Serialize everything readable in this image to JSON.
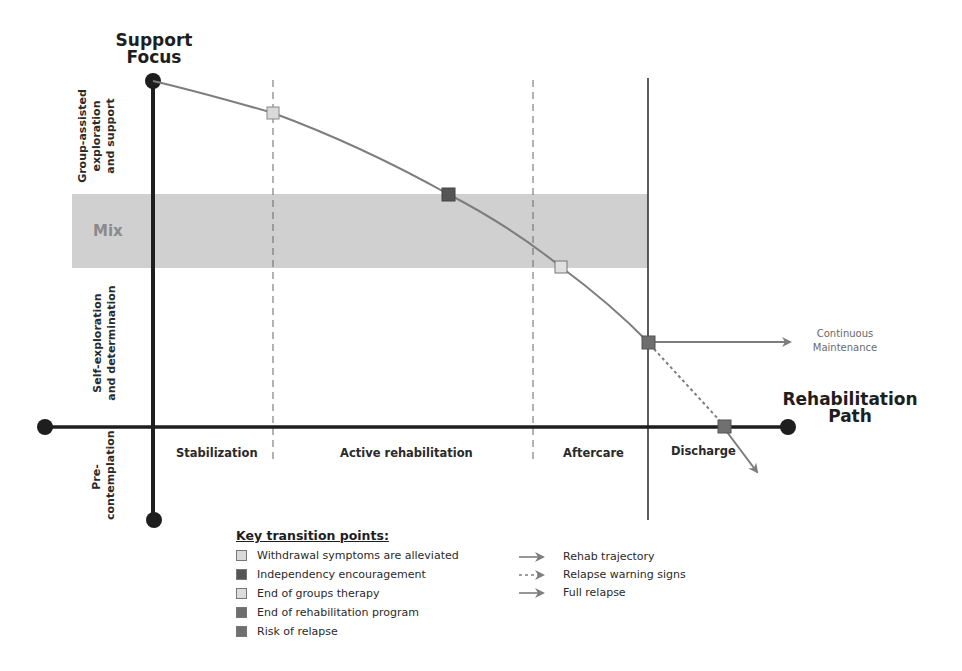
{
  "diagram": {
    "y_axis_title": "Support Focus",
    "y_axis_title_lines": [
      "Support",
      "Focus"
    ],
    "x_axis_title_lines": [
      "Rehabilitation",
      "Path"
    ],
    "x_axis_title": "Rehabilitation Path",
    "y_zones": [
      {
        "id": "group",
        "lines": [
          "Group-assisted",
          "exploration",
          "and support"
        ]
      },
      {
        "id": "mix",
        "label": "Mix"
      },
      {
        "id": "self",
        "lines": [
          "Self-exploration",
          "and determination"
        ]
      },
      {
        "id": "pre",
        "lines": [
          "Pre-",
          "contemplation"
        ]
      }
    ],
    "phases": [
      {
        "label": "Stabilization"
      },
      {
        "label": "Active rehabilitation"
      },
      {
        "label": "Aftercare"
      },
      {
        "label": "Discharge"
      }
    ],
    "continuous_maintenance_lines": [
      "Continuous",
      "Maintenance"
    ],
    "colors": {
      "axis": "#1e1e1e",
      "curve": "#7d7d7d",
      "band": "#d0d0d0",
      "marker_light": "#d9d9d9",
      "marker_dark": "#555555",
      "marker_medium": "#777777",
      "dashed": "#666666"
    }
  },
  "legend": {
    "title": "Key transition points:",
    "markers": [
      {
        "label": "Withdrawal symptoms are alleviated",
        "color": "#d9d9d9"
      },
      {
        "label": "Independency encouragement",
        "color": "#555555"
      },
      {
        "label": "End of groups therapy",
        "color": "#dcdcdc"
      },
      {
        "label": "End of rehabilitation program",
        "color": "#6e6e6e"
      },
      {
        "label": "Risk of relapse",
        "color": "#707070"
      }
    ],
    "lines": [
      {
        "label": "Rehab trajectory",
        "style": "solid"
      },
      {
        "label": "Relapse warning signs",
        "style": "dotted"
      },
      {
        "label": "Full relapse",
        "style": "solid"
      }
    ]
  }
}
